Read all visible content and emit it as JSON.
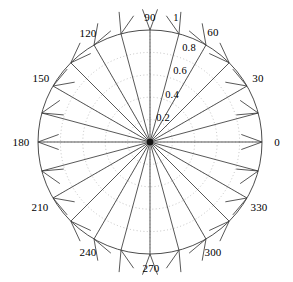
{
  "figure": {
    "title": "",
    "type": "polar-compass-plot",
    "background_color": "#ffffff",
    "axis_color": "#4d4d4d",
    "grid_color": "#aaaaaa",
    "arrow_color": "#3a3a3a",
    "text_color": "#000000",
    "center": {
      "x": 150,
      "y": 142
    },
    "radius_px": 112
  },
  "chart_data": {
    "type": "scatter",
    "subtype": "polar-compass",
    "title": "",
    "xlabel": "",
    "ylabel": "",
    "rlim": [
      0,
      1
    ],
    "theta_unit": "degrees",
    "grid": true,
    "legend": null,
    "angle_tick_labels": [
      "0",
      "30",
      "60",
      "90",
      "120",
      "150",
      "180",
      "210",
      "240",
      "270",
      "300",
      "330"
    ],
    "angle_ticks": [
      0,
      30,
      60,
      90,
      120,
      150,
      180,
      210,
      240,
      270,
      300,
      330
    ],
    "radial_tick_labels": [
      "0.2",
      "0.4",
      "0.6",
      "0.8",
      "1"
    ],
    "radial_ticks": [
      0.2,
      0.4,
      0.6,
      0.8,
      1
    ],
    "radial_label_angle": 75,
    "series": [
      {
        "name": "unit-vectors",
        "theta": [
          0,
          15,
          30,
          45,
          60,
          75,
          90,
          105,
          120,
          135,
          150,
          165,
          180,
          195,
          210,
          225,
          240,
          255,
          270,
          285,
          300,
          315,
          330,
          345
        ],
        "r": [
          1,
          1,
          1,
          1,
          1,
          1,
          1,
          1,
          1,
          1,
          1,
          1,
          1,
          1,
          1,
          1,
          1,
          1,
          1,
          1,
          1,
          1,
          1,
          1
        ]
      }
    ]
  },
  "angle_labels": [
    {
      "text": "0",
      "deg": 0,
      "x": 277,
      "y": 142
    },
    {
      "text": "30",
      "deg": 30,
      "x": 258,
      "y": 78
    },
    {
      "text": "60",
      "deg": 60,
      "x": 213,
      "y": 32
    },
    {
      "text": "90",
      "deg": 90,
      "x": 150,
      "y": 17
    },
    {
      "text": "120",
      "deg": 120,
      "x": 88,
      "y": 33
    },
    {
      "text": "150",
      "deg": 150,
      "x": 41,
      "y": 78
    },
    {
      "text": "180",
      "deg": 180,
      "x": 21,
      "y": 142
    },
    {
      "text": "210",
      "deg": 210,
      "x": 40,
      "y": 207
    },
    {
      "text": "240",
      "deg": 240,
      "x": 88,
      "y": 252
    },
    {
      "text": "270",
      "deg": 270,
      "x": 151,
      "y": 268
    },
    {
      "text": "300",
      "deg": 300,
      "x": 213,
      "y": 252
    },
    {
      "text": "330",
      "deg": 330,
      "x": 259,
      "y": 207
    }
  ],
  "radial_labels": [
    {
      "text": "1",
      "value": 1.0,
      "x": 176,
      "y": 18
    },
    {
      "text": "0.8",
      "value": 0.8,
      "x": 189,
      "y": 48
    },
    {
      "text": "0.6",
      "value": 0.6,
      "x": 180,
      "y": 71
    },
    {
      "text": "0.4",
      "value": 0.4,
      "x": 172,
      "y": 95
    },
    {
      "text": "0.2",
      "value": 0.2,
      "x": 163,
      "y": 118
    }
  ]
}
